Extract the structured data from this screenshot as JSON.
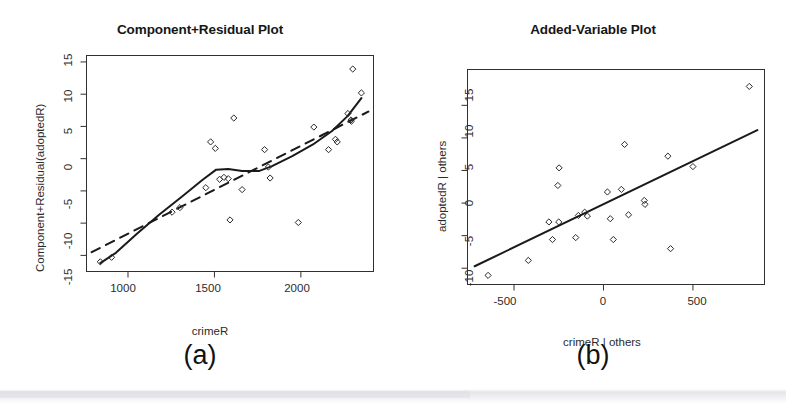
{
  "figure": {
    "background_color": "#ffffff",
    "ink_color": "#1a1a1a"
  },
  "panels": [
    {
      "id": "a",
      "caption": "(a)",
      "chart_ref": 0
    },
    {
      "id": "b",
      "caption": "(b)",
      "chart_ref": 1
    }
  ],
  "chart_data": [
    {
      "type": "scatter",
      "title": "Component+Residual Plot",
      "xlabel": "crimeR",
      "ylabel": "Component+Residual(adoptedR)",
      "xlim": [
        760,
        2420
      ],
      "ylim": [
        -17.5,
        16.0
      ],
      "xticks": [
        1000,
        1500,
        2000
      ],
      "xtick_labels": [
        "1000",
        "1500",
        "2000"
      ],
      "yticks": [
        15,
        10,
        5,
        0,
        -5,
        -10,
        -15
      ],
      "ytick_labels": [
        "15",
        "10",
        "5",
        "0",
        "-5",
        "-10",
        "-15"
      ],
      "grid": false,
      "legend": "none",
      "points": [
        {
          "x": 840,
          "y": -16.0
        },
        {
          "x": 905,
          "y": -15.3
        },
        {
          "x": 1255,
          "y": -8.3
        },
        {
          "x": 1300,
          "y": -7.6
        },
        {
          "x": 1450,
          "y": -4.5
        },
        {
          "x": 1478,
          "y": 2.6
        },
        {
          "x": 1505,
          "y": 1.6
        },
        {
          "x": 1530,
          "y": -3.2
        },
        {
          "x": 1555,
          "y": -2.9
        },
        {
          "x": 1580,
          "y": -3.1
        },
        {
          "x": 1590,
          "y": -9.5
        },
        {
          "x": 1612,
          "y": 6.3
        },
        {
          "x": 1660,
          "y": -4.8
        },
        {
          "x": 1790,
          "y": 1.4
        },
        {
          "x": 1812,
          "y": -1.3
        },
        {
          "x": 1822,
          "y": -3.0
        },
        {
          "x": 1985,
          "y": -9.9
        },
        {
          "x": 2075,
          "y": 4.9
        },
        {
          "x": 2160,
          "y": 1.4
        },
        {
          "x": 2200,
          "y": 3.0
        },
        {
          "x": 2210,
          "y": 2.6
        },
        {
          "x": 2272,
          "y": 7.0
        },
        {
          "x": 2290,
          "y": 6.0
        },
        {
          "x": 2292,
          "y": 5.8
        },
        {
          "x": 2300,
          "y": 13.9
        },
        {
          "x": 2350,
          "y": 10.2
        }
      ],
      "series": [
        {
          "name": "loess-smooth",
          "style": "solid",
          "points": [
            {
              "x": 840,
              "y": -16.2
            },
            {
              "x": 930,
              "y": -14.6
            },
            {
              "x": 1050,
              "y": -11.7
            },
            {
              "x": 1180,
              "y": -8.7
            },
            {
              "x": 1320,
              "y": -5.7
            },
            {
              "x": 1430,
              "y": -3.3
            },
            {
              "x": 1510,
              "y": -1.7
            },
            {
              "x": 1580,
              "y": -1.6
            },
            {
              "x": 1660,
              "y": -1.9
            },
            {
              "x": 1760,
              "y": -1.9
            },
            {
              "x": 1830,
              "y": -1.2
            },
            {
              "x": 1950,
              "y": 0.4
            },
            {
              "x": 2070,
              "y": 2.2
            },
            {
              "x": 2180,
              "y": 4.3
            },
            {
              "x": 2270,
              "y": 6.6
            },
            {
              "x": 2350,
              "y": 9.4
            }
          ]
        },
        {
          "name": "linear-fit",
          "style": "dashed",
          "points": [
            {
              "x": 790,
              "y": -14.5
            },
            {
              "x": 2390,
              "y": 7.3
            }
          ]
        }
      ]
    },
    {
      "type": "scatter",
      "title": "Added-Variable Plot",
      "xlabel": "crimeR | others",
      "ylabel": "adoptedR | others",
      "xlim": [
        -760,
        900
      ],
      "ylim": [
        -12.5,
        20.5
      ],
      "xticks": [
        -500,
        0,
        500
      ],
      "xtick_labels": [
        "-500",
        "0",
        "500"
      ],
      "yticks": [
        15,
        10,
        5,
        0,
        -5,
        -10
      ],
      "ytick_labels": [
        "15",
        "10",
        "5",
        "0",
        "-5",
        "-10"
      ],
      "grid": false,
      "legend": "none",
      "points": [
        {
          "x": -645,
          "y": -11.1
        },
        {
          "x": -420,
          "y": -8.8
        },
        {
          "x": -305,
          "y": -2.9
        },
        {
          "x": -285,
          "y": -5.6
        },
        {
          "x": -248,
          "y": 5.4
        },
        {
          "x": -250,
          "y": -2.9
        },
        {
          "x": -255,
          "y": 2.7
        },
        {
          "x": -155,
          "y": -5.3
        },
        {
          "x": -140,
          "y": -1.9
        },
        {
          "x": -105,
          "y": -1.4
        },
        {
          "x": -90,
          "y": -2.0
        },
        {
          "x": 22,
          "y": 1.7
        },
        {
          "x": 38,
          "y": -2.4
        },
        {
          "x": 55,
          "y": -5.6
        },
        {
          "x": 100,
          "y": 2.1
        },
        {
          "x": 118,
          "y": 9.0
        },
        {
          "x": 140,
          "y": -1.8
        },
        {
          "x": 228,
          "y": 0.4
        },
        {
          "x": 232,
          "y": -0.2
        },
        {
          "x": 360,
          "y": 7.2
        },
        {
          "x": 375,
          "y": -7.0
        },
        {
          "x": 500,
          "y": 5.6
        },
        {
          "x": 815,
          "y": 17.9
        }
      ],
      "series": [
        {
          "name": "regression-line",
          "style": "solid",
          "points": [
            {
              "x": -720,
              "y": -9.7
            },
            {
              "x": 860,
              "y": 11.2
            }
          ]
        }
      ]
    }
  ]
}
